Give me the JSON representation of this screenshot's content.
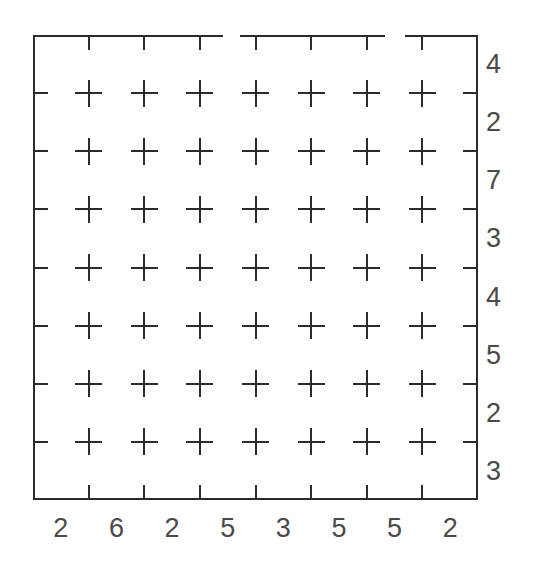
{
  "chart_data": {
    "type": "scatter",
    "title": "",
    "subtitle": "",
    "xlabel": "",
    "ylabel": "",
    "grid": false,
    "legend": null,
    "marker": "plus",
    "rows": 7,
    "columns": 7,
    "x": [
      1,
      2,
      3,
      4,
      5,
      6,
      7
    ],
    "y": [
      1,
      2,
      3,
      4,
      5,
      6,
      7
    ],
    "points": [
      {
        "x": 1,
        "y": 7
      },
      {
        "x": 2,
        "y": 7
      },
      {
        "x": 3,
        "y": 7
      },
      {
        "x": 4,
        "y": 7
      },
      {
        "x": 5,
        "y": 7
      },
      {
        "x": 6,
        "y": 7
      },
      {
        "x": 7,
        "y": 7
      },
      {
        "x": 1,
        "y": 6
      },
      {
        "x": 2,
        "y": 6
      },
      {
        "x": 3,
        "y": 6
      },
      {
        "x": 4,
        "y": 6
      },
      {
        "x": 5,
        "y": 6
      },
      {
        "x": 6,
        "y": 6
      },
      {
        "x": 7,
        "y": 6
      },
      {
        "x": 1,
        "y": 5
      },
      {
        "x": 2,
        "y": 5
      },
      {
        "x": 3,
        "y": 5
      },
      {
        "x": 4,
        "y": 5
      },
      {
        "x": 5,
        "y": 5
      },
      {
        "x": 6,
        "y": 5
      },
      {
        "x": 7,
        "y": 5
      },
      {
        "x": 1,
        "y": 4
      },
      {
        "x": 2,
        "y": 4
      },
      {
        "x": 3,
        "y": 4
      },
      {
        "x": 4,
        "y": 4
      },
      {
        "x": 5,
        "y": 4
      },
      {
        "x": 6,
        "y": 4
      },
      {
        "x": 7,
        "y": 4
      },
      {
        "x": 1,
        "y": 3
      },
      {
        "x": 2,
        "y": 3
      },
      {
        "x": 3,
        "y": 3
      },
      {
        "x": 4,
        "y": 3
      },
      {
        "x": 5,
        "y": 3
      },
      {
        "x": 6,
        "y": 3
      },
      {
        "x": 7,
        "y": 3
      },
      {
        "x": 1,
        "y": 2
      },
      {
        "x": 2,
        "y": 2
      },
      {
        "x": 3,
        "y": 2
      },
      {
        "x": 4,
        "y": 2
      },
      {
        "x": 5,
        "y": 2
      },
      {
        "x": 6,
        "y": 2
      },
      {
        "x": 7,
        "y": 2
      },
      {
        "x": 1,
        "y": 1
      },
      {
        "x": 2,
        "y": 1
      },
      {
        "x": 3,
        "y": 1
      },
      {
        "x": 4,
        "y": 1
      },
      {
        "x": 5,
        "y": 1
      },
      {
        "x": 6,
        "y": 1
      },
      {
        "x": 7,
        "y": 1
      }
    ],
    "x_tick_labels": [
      "2",
      "6",
      "2",
      "5",
      "3",
      "5",
      "5",
      "2"
    ],
    "y_tick_labels": [
      "4",
      "2",
      "7",
      "3",
      "4",
      "5",
      "2",
      "3"
    ],
    "x_tick_count": 7,
    "y_tick_count": 7
  },
  "axes": {
    "right_labels": [
      {
        "text": "4"
      },
      {
        "text": "2"
      },
      {
        "text": "7"
      },
      {
        "text": "3"
      },
      {
        "text": "4"
      },
      {
        "text": "5"
      },
      {
        "text": "2"
      },
      {
        "text": "3"
      }
    ],
    "bottom_labels": [
      {
        "text": "2"
      },
      {
        "text": "6"
      },
      {
        "text": "2"
      },
      {
        "text": "5"
      },
      {
        "text": "3"
      },
      {
        "text": "5"
      },
      {
        "text": "5"
      },
      {
        "text": "2"
      }
    ]
  },
  "style": {
    "background": "#ffffff",
    "line_color": "#2b2b2b",
    "label_color": "#4a4a4a",
    "marker_color": "#2b2b2b"
  }
}
